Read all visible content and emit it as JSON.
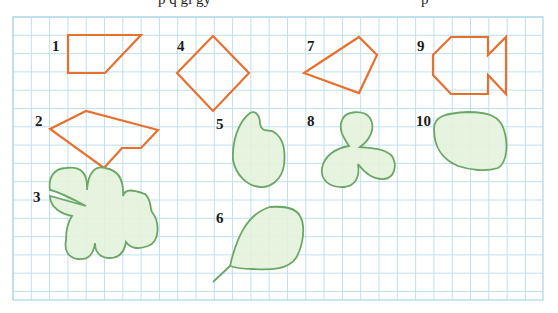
{
  "page": {
    "top_text_fragments": [
      "p q gi gy",
      "p"
    ]
  },
  "grid": {
    "x0": 13,
    "y0": 17,
    "x1": 543,
    "y1": 300,
    "cell": 18.3,
    "line_color": "#bfe0ee",
    "border_color": "#a9d5e8"
  },
  "colors": {
    "polygon_stroke": "#e8702e",
    "blob_stroke": "#6aa765",
    "blob_fill": "#e3f2dc",
    "label": "#1a1a1a"
  },
  "figures": [
    {
      "id": 1,
      "label": "1",
      "type": "polygon",
      "label_pos": [
        52,
        51
      ],
      "points": "68,35 141,35 105,73 68,73"
    },
    {
      "id": 2,
      "label": "2",
      "type": "polygon",
      "label_pos": [
        35,
        126
      ],
      "points": "50,129 86,111 158,130 141,148 122,148 104,168"
    },
    {
      "id": 3,
      "label": "3",
      "type": "blob",
      "label_pos": [
        33,
        202
      ]
    },
    {
      "id": 4,
      "label": "4",
      "type": "polygon",
      "label_pos": [
        177,
        51
      ],
      "points": "213,36 249,73 213,111 177,73"
    },
    {
      "id": 5,
      "label": "5",
      "type": "blob",
      "label_pos": [
        216,
        129
      ]
    },
    {
      "id": 6,
      "label": "6",
      "type": "blob",
      "label_pos": [
        216,
        223
      ]
    },
    {
      "id": 7,
      "label": "7",
      "type": "polygon",
      "label_pos": [
        307,
        51
      ],
      "points": "304,73 359,37 377,55 359,93"
    },
    {
      "id": 8,
      "label": "8",
      "type": "blob",
      "label_pos": [
        307,
        126
      ]
    },
    {
      "id": 9,
      "label": "9",
      "type": "polygon",
      "label_pos": [
        417,
        51
      ],
      "points": "433,55 451,37 488,37 488,55 506,37 506,94 488,75 488,94 451,94 433,75"
    },
    {
      "id": 10,
      "label": "10",
      "type": "blob",
      "label_pos": [
        416,
        126
      ]
    }
  ]
}
